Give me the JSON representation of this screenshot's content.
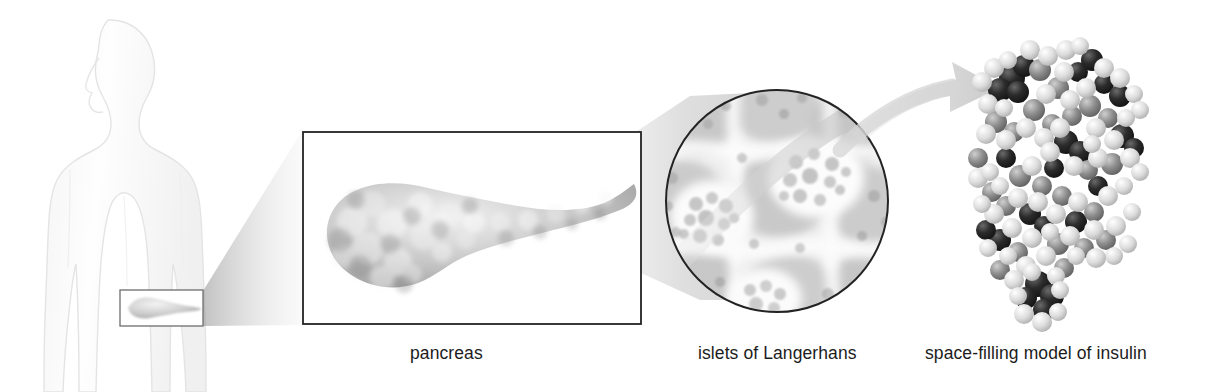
{
  "figure": {
    "background_color": "#ffffff",
    "width": 1214,
    "height": 392
  },
  "captions": [
    {
      "id": "pancreas",
      "text": "pancreas",
      "x": 410,
      "y": 345
    },
    {
      "id": "islets",
      "text": "islets of Langerhans",
      "x": 698,
      "y": 345
    },
    {
      "id": "insulin",
      "text": "space-filling model of insulin",
      "x": 925,
      "y": 345
    }
  ],
  "panels": {
    "body_silhouette": {
      "label": "human body outline",
      "outline_color": "#e2e2e2",
      "fill_color": "#fdfdfd",
      "x": 25,
      "y": 18,
      "width": 175,
      "height": 374
    },
    "body_inset_box": {
      "label": "pancreas location inset",
      "border_color": "#6d6d6d",
      "x": 119,
      "y": 289,
      "width": 85,
      "height": 38
    },
    "pancreas_box": {
      "label": "pancreas detail box",
      "border_color": "#232323",
      "x": 302,
      "y": 131,
      "width": 340,
      "height": 194
    },
    "islets_circle": {
      "label": "islets of Langerhans micrograph",
      "border_color": "#232323",
      "cx": 777,
      "cy": 201,
      "r": 112
    },
    "insulin_model": {
      "label": "space-filling insulin molecule",
      "x": 975,
      "y": 42,
      "width": 172,
      "height": 285
    }
  },
  "connectors": [
    {
      "id": "wedge-body-to-pancreas",
      "label": "magnification wedge from body inset to pancreas box",
      "color": "#c9c9c9"
    },
    {
      "id": "band-pancreas-to-islets",
      "label": "magnification band from pancreas box to islets circle",
      "color": "#d2d2d2"
    },
    {
      "id": "arrow-islets-to-insulin",
      "label": "curved arrow from islets to insulin model",
      "color": "#d0d0d0"
    }
  ],
  "colors": {
    "text": "#1c1c1c",
    "line_dark": "#232323",
    "line_mid": "#6d6d6d",
    "tissue_light": "#e9e9e9",
    "tissue_mid": "#bdbdbd",
    "tissue_dark": "#9a9a9a",
    "atom_light": "#e6e6e6",
    "atom_mid": "#8a8a8a",
    "atom_dark": "#1e1e1e"
  }
}
